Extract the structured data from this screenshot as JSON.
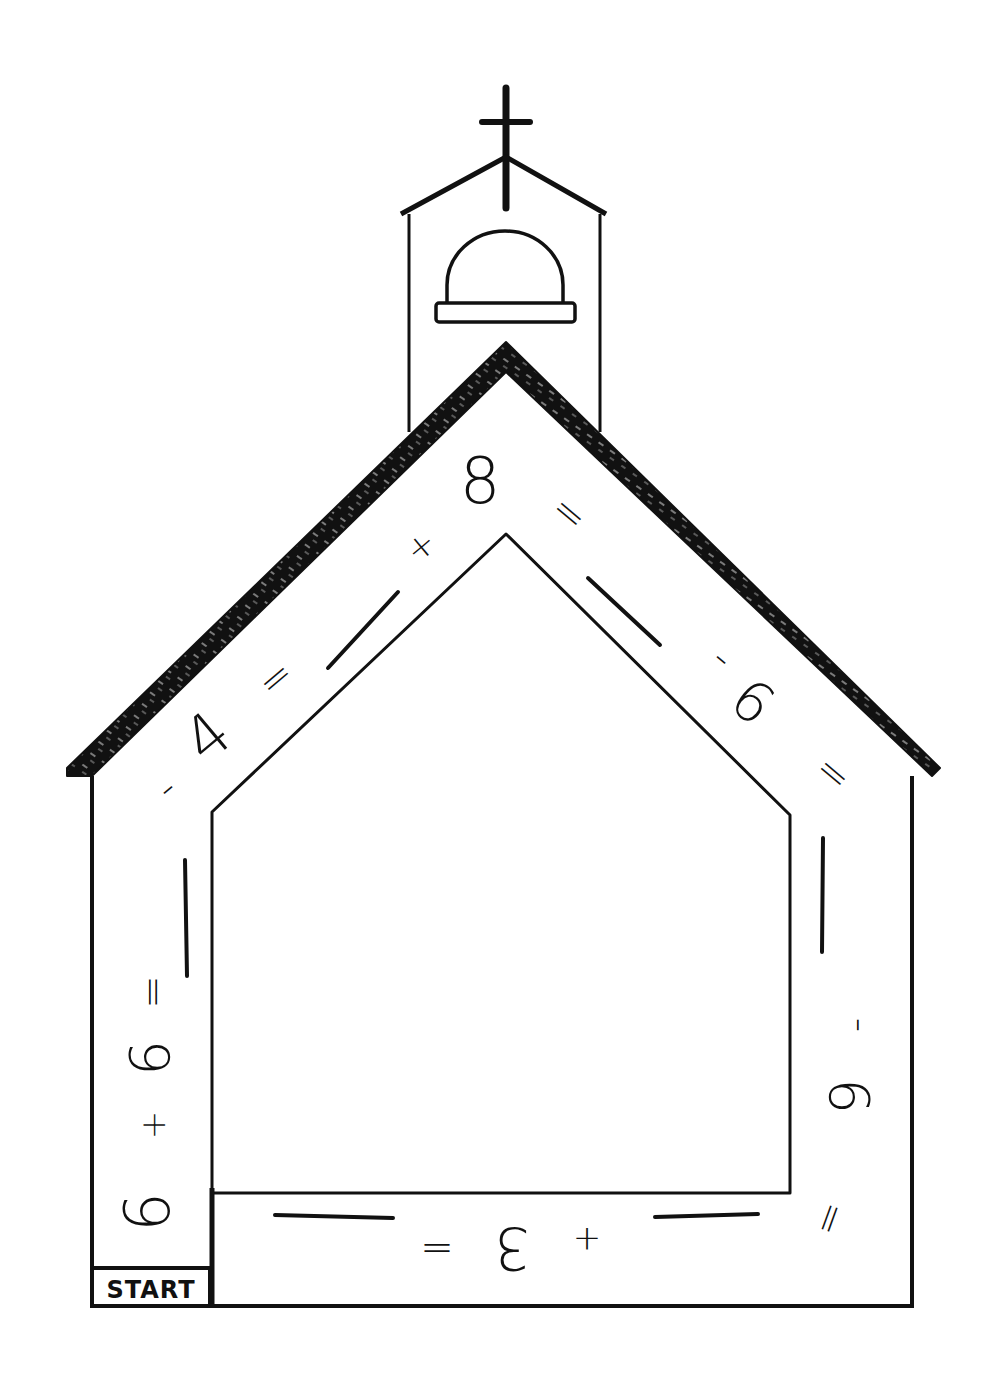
{
  "worksheet": {
    "start_label": "START",
    "colors": {
      "ink": "#111111",
      "paper": "#ffffff"
    },
    "path_tokens": [
      {
        "id": "t1",
        "text": "6",
        "segment": "left-wall",
        "x": 152,
        "y": 1212,
        "rotate": -90,
        "size": 62
      },
      {
        "id": "t2",
        "text": "+",
        "segment": "left-wall",
        "x": 155,
        "y": 1125,
        "rotate": -90,
        "size": 34
      },
      {
        "id": "t3",
        "text": "6",
        "segment": "left-wall",
        "x": 154,
        "y": 1058,
        "rotate": -90,
        "size": 56
      },
      {
        "id": "t4",
        "text": "=",
        "segment": "left-wall",
        "x": 155,
        "y": 992,
        "rotate": -90,
        "size": 40
      },
      {
        "id": "t5",
        "text": "-",
        "segment": "left-roof",
        "x": 168,
        "y": 790,
        "rotate": -40,
        "size": 40
      },
      {
        "id": "t6",
        "text": "4",
        "segment": "left-roof",
        "x": 210,
        "y": 740,
        "rotate": -40,
        "size": 62
      },
      {
        "id": "t7",
        "text": "=",
        "segment": "left-roof",
        "x": 277,
        "y": 680,
        "rotate": -40,
        "size": 40
      },
      {
        "id": "t8",
        "text": "+",
        "segment": "left-roof",
        "x": 422,
        "y": 548,
        "rotate": -40,
        "size": 34
      },
      {
        "id": "t9",
        "text": "8",
        "segment": "apex",
        "x": 480,
        "y": 485,
        "rotate": 0,
        "size": 64
      },
      {
        "id": "t10",
        "text": "=",
        "segment": "right-roof",
        "x": 568,
        "y": 515,
        "rotate": 40,
        "size": 40
      },
      {
        "id": "t11",
        "text": "-",
        "segment": "right-roof",
        "x": 721,
        "y": 660,
        "rotate": 40,
        "size": 40
      },
      {
        "id": "t12",
        "text": "6",
        "segment": "right-roof",
        "x": 750,
        "y": 705,
        "rotate": 40,
        "size": 56
      },
      {
        "id": "t13",
        "text": "=",
        "segment": "right-roof",
        "x": 832,
        "y": 775,
        "rotate": 40,
        "size": 40
      },
      {
        "id": "t14",
        "text": "-",
        "segment": "right-wall",
        "x": 858,
        "y": 1025,
        "rotate": 90,
        "size": 40
      },
      {
        "id": "t15",
        "text": "6",
        "segment": "right-wall",
        "x": 845,
        "y": 1096,
        "rotate": 90,
        "size": 56
      },
      {
        "id": "t16",
        "text": "=",
        "segment": "bottom",
        "x": 828,
        "y": 1218,
        "rotate": 110,
        "size": 40
      },
      {
        "id": "t17",
        "text": "+",
        "segment": "bottom",
        "x": 587,
        "y": 1237,
        "rotate": 180,
        "size": 34
      },
      {
        "id": "t18",
        "text": "3",
        "segment": "bottom",
        "x": 512,
        "y": 1244,
        "rotate": 180,
        "size": 58
      },
      {
        "id": "t19",
        "text": "=",
        "segment": "bottom",
        "x": 437,
        "y": 1246,
        "rotate": 180,
        "size": 40
      }
    ],
    "answer_blanks": [
      {
        "id": "b1",
        "segment": "left-wall",
        "x1": 187,
        "y1": 976,
        "x2": 185,
        "y2": 860
      },
      {
        "id": "b2",
        "segment": "left-roof",
        "x1": 328,
        "y1": 668,
        "x2": 398,
        "y2": 592
      },
      {
        "id": "b3",
        "segment": "right-roof",
        "x1": 588,
        "y1": 578,
        "x2": 660,
        "y2": 645
      },
      {
        "id": "b4",
        "segment": "right-wall",
        "x1": 823,
        "y1": 838,
        "x2": 822,
        "y2": 952
      },
      {
        "id": "b5",
        "segment": "bottom",
        "x1": 655,
        "y1": 1217,
        "x2": 758,
        "y2": 1214
      },
      {
        "id": "b6",
        "segment": "bottom",
        "x1": 275,
        "y1": 1215,
        "x2": 393,
        "y2": 1218
      }
    ]
  }
}
